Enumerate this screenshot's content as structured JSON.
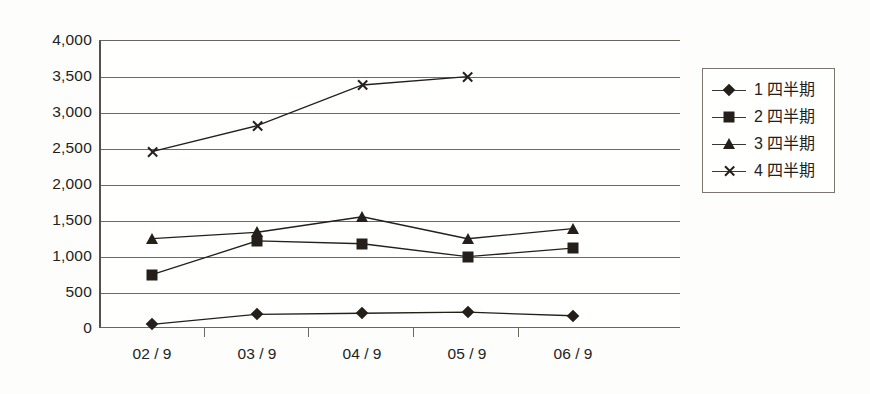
{
  "chart_data": {
    "type": "line",
    "title": "",
    "xlabel": "",
    "ylabel": "",
    "categories": [
      "02 / 9",
      "03 / 9",
      "04 / 9",
      "05 / 9",
      "06 / 9"
    ],
    "ylim": [
      0,
      4000
    ],
    "yticks": [
      4000,
      3500,
      3000,
      2500,
      2000,
      1500,
      1000,
      500,
      0
    ],
    "ytick_labels": [
      "4,000",
      "3,500",
      "3,000",
      "2,500",
      "2,000",
      "1,500",
      "1,000",
      "500",
      "0"
    ],
    "grid": true,
    "legend_position": "right",
    "series": [
      {
        "name": "1 四半期",
        "marker": "diamond",
        "color": "#241f1b",
        "values": [
          50,
          190,
          205,
          220,
          170
        ]
      },
      {
        "name": "2 四半期",
        "marker": "square",
        "color": "#241f1b",
        "values": [
          740,
          1210,
          1170,
          990,
          1110
        ]
      },
      {
        "name": "3 四半期",
        "marker": "triangle",
        "color": "#241f1b",
        "values": [
          1240,
          1330,
          1545,
          1240,
          1380
        ]
      },
      {
        "name": "4 四半期",
        "marker": "cross",
        "color": "#241f1b",
        "values": [
          2450,
          2810,
          3375,
          3490,
          null
        ]
      }
    ]
  },
  "axis": {
    "y_labels": [
      "4,000",
      "3,500",
      "3,000",
      "2,500",
      "2,000",
      "1,500",
      "1,000",
      "500",
      "0"
    ],
    "x_labels": [
      "02 / 9",
      "03 / 9",
      "04 / 9",
      "05 / 9",
      "06 / 9"
    ]
  },
  "legend": {
    "items": [
      {
        "label": "1 四半期",
        "marker": "diamond"
      },
      {
        "label": "2 四半期",
        "marker": "square"
      },
      {
        "label": "3 四半期",
        "marker": "triangle"
      },
      {
        "label": "4 四半期",
        "marker": "cross"
      }
    ]
  },
  "colors": {
    "ink": "#241f1b",
    "grid": "#6f6964",
    "axis": "#55504c",
    "background": "#fdfdfc"
  }
}
